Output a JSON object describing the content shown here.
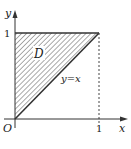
{
  "diagram": {
    "type": "region-plot",
    "axes": {
      "x_label": "x",
      "y_label": "y",
      "origin_label": "O",
      "x_tick": "1",
      "y_tick": "1"
    },
    "region": {
      "label": "D",
      "description": "triangle bounded by x=0, y=1, and y=x",
      "vertices": [
        [
          0,
          0
        ],
        [
          0,
          1
        ],
        [
          1,
          1
        ]
      ],
      "fill": "hatched"
    },
    "curve": {
      "label": "y=x"
    },
    "colors": {
      "stroke": "#333333",
      "hatch": "#555555",
      "background": "#ffffff"
    }
  }
}
